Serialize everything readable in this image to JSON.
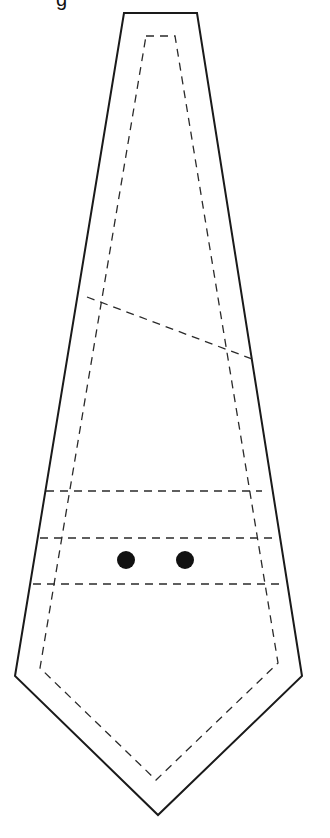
{
  "diagram": {
    "caption_fragment": "g",
    "colors": {
      "line": "#1a1a1a",
      "dot": "#111111",
      "background": "#ffffff"
    },
    "elements": {
      "cut_line": "solid outline",
      "seam_line": "dashed inner outline",
      "diagonal_line": "dashed diagonal guide",
      "horizontal_lines": 3,
      "marker_dots": 2
    }
  }
}
